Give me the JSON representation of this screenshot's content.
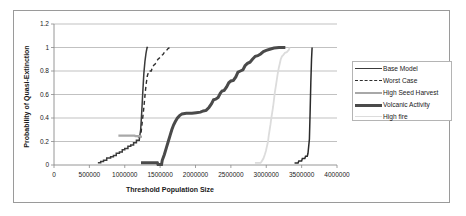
{
  "chart_data": {
    "type": "line",
    "title": "",
    "xlabel": "Threshold Population Size",
    "ylabel": "Probability of Quasi-Extinction",
    "xlim": [
      0,
      4000000
    ],
    "ylim": [
      0,
      1.2
    ],
    "xticks": [
      0,
      500000,
      1000000,
      1500000,
      2000000,
      2500000,
      3000000,
      3500000,
      4000000
    ],
    "xtick_labels": [
      "0",
      "500000",
      "1000000",
      "1500000",
      "2000000",
      "2500000",
      "3000000",
      "3500000",
      "4000000"
    ],
    "yticks": [
      0,
      0.2,
      0.4,
      0.6,
      0.8,
      1,
      1.2
    ],
    "ytick_labels": [
      "0",
      "0.2",
      "0.4",
      "0.6",
      "0.8",
      "1",
      "1.2"
    ],
    "grid": "horizontal",
    "legend_position": "right",
    "series": [
      {
        "name": "Base Model",
        "color": "#3b3b3b",
        "width": 1.5,
        "dash": "none",
        "points": [
          [
            620000,
            0.02
          ],
          [
            660000,
            0.02
          ],
          [
            660000,
            0.03
          ],
          [
            700000,
            0.03
          ],
          [
            700000,
            0.04
          ],
          [
            745000,
            0.04
          ],
          [
            745000,
            0.06
          ],
          [
            800000,
            0.06
          ],
          [
            800000,
            0.07
          ],
          [
            840000,
            0.07
          ],
          [
            840000,
            0.08
          ],
          [
            880000,
            0.08
          ],
          [
            880000,
            0.1
          ],
          [
            925000,
            0.1
          ],
          [
            925000,
            0.11
          ],
          [
            965000,
            0.11
          ],
          [
            965000,
            0.13
          ],
          [
            1000000,
            0.13
          ],
          [
            1000000,
            0.14
          ],
          [
            1045000,
            0.14
          ],
          [
            1045000,
            0.16
          ],
          [
            1085000,
            0.16
          ],
          [
            1085000,
            0.17
          ],
          [
            1125000,
            0.17
          ],
          [
            1125000,
            0.19
          ],
          [
            1165000,
            0.19
          ],
          [
            1165000,
            0.21
          ],
          [
            1205000,
            0.21
          ],
          [
            1210000,
            0.24
          ],
          [
            1225000,
            0.3
          ],
          [
            1240000,
            0.45
          ],
          [
            1255000,
            0.62
          ],
          [
            1270000,
            0.78
          ],
          [
            1285000,
            0.88
          ],
          [
            1300000,
            0.95
          ],
          [
            1315000,
            1.0
          ],
          [
            1330000,
            1.0
          ]
        ]
      },
      {
        "name": "Worst Case",
        "color": "#2e2e2e",
        "width": 1.4,
        "dash": "4,3",
        "points": [
          [
            1185000,
            0.24
          ],
          [
            1225000,
            0.24
          ],
          [
            1235000,
            0.3
          ],
          [
            1250000,
            0.38
          ],
          [
            1265000,
            0.46
          ],
          [
            1278000,
            0.54
          ],
          [
            1290000,
            0.62
          ],
          [
            1305000,
            0.7
          ],
          [
            1320000,
            0.76
          ],
          [
            1340000,
            0.8
          ],
          [
            1375000,
            0.8
          ],
          [
            1390000,
            0.83
          ],
          [
            1410000,
            0.85
          ],
          [
            1430000,
            0.86
          ],
          [
            1450000,
            0.88
          ],
          [
            1470000,
            0.9
          ],
          [
            1490000,
            0.91
          ],
          [
            1515000,
            0.93
          ],
          [
            1540000,
            0.94
          ],
          [
            1560000,
            0.96
          ],
          [
            1585000,
            0.97
          ],
          [
            1610000,
            0.99
          ],
          [
            1635000,
            1.0
          ]
        ]
      },
      {
        "name": "High Seed Harvest",
        "color": "#a8a8a8",
        "width": 2.2,
        "dash": "none",
        "points": [
          [
            910000,
            0.25
          ],
          [
            1140000,
            0.25
          ],
          [
            1150000,
            0.245
          ],
          [
            1215000,
            0.245
          ],
          [
            1222000,
            0.24
          ],
          [
            1240000,
            0.24
          ]
        ]
      },
      {
        "name": "Volcanic Activity",
        "color": "#4a4a4a",
        "width": 3.0,
        "dash": "none",
        "points": [
          [
            1230000,
            0.02
          ],
          [
            1400000,
            0.02
          ],
          [
            1460000,
            0.02
          ],
          [
            1470000,
            0.005
          ],
          [
            1520000,
            0.005
          ],
          [
            1530000,
            0.04
          ],
          [
            1560000,
            0.09
          ],
          [
            1590000,
            0.15
          ],
          [
            1615000,
            0.2
          ],
          [
            1640000,
            0.25
          ],
          [
            1665000,
            0.3
          ],
          [
            1690000,
            0.34
          ],
          [
            1715000,
            0.37
          ],
          [
            1745000,
            0.4
          ],
          [
            1775000,
            0.42
          ],
          [
            1810000,
            0.435
          ],
          [
            1870000,
            0.44
          ],
          [
            1950000,
            0.44
          ],
          [
            2010000,
            0.445
          ],
          [
            2070000,
            0.45
          ],
          [
            2110000,
            0.46
          ],
          [
            2150000,
            0.465
          ],
          [
            2190000,
            0.49
          ],
          [
            2225000,
            0.52
          ],
          [
            2255000,
            0.555
          ],
          [
            2285000,
            0.56
          ],
          [
            2320000,
            0.575
          ],
          [
            2350000,
            0.61
          ],
          [
            2375000,
            0.63
          ],
          [
            2405000,
            0.635
          ],
          [
            2440000,
            0.665
          ],
          [
            2470000,
            0.7
          ],
          [
            2500000,
            0.715
          ],
          [
            2535000,
            0.72
          ],
          [
            2570000,
            0.75
          ],
          [
            2600000,
            0.79
          ],
          [
            2635000,
            0.8
          ],
          [
            2670000,
            0.81
          ],
          [
            2700000,
            0.845
          ],
          [
            2735000,
            0.865
          ],
          [
            2770000,
            0.875
          ],
          [
            2805000,
            0.9
          ],
          [
            2845000,
            0.925
          ],
          [
            2880000,
            0.93
          ],
          [
            2920000,
            0.945
          ],
          [
            2960000,
            0.965
          ],
          [
            3000000,
            0.975
          ],
          [
            3050000,
            0.985
          ],
          [
            3110000,
            0.995
          ],
          [
            3180000,
            1.0
          ],
          [
            3270000,
            1.0
          ]
        ]
      },
      {
        "name": "High fire",
        "color": "#dcdcdc",
        "width": 1.8,
        "dash": "none",
        "points": [
          [
            2840000,
            0.018
          ],
          [
            2920000,
            0.018
          ],
          [
            2935000,
            0.03
          ],
          [
            2960000,
            0.055
          ],
          [
            2980000,
            0.09
          ],
          [
            2995000,
            0.12
          ],
          [
            3010000,
            0.16
          ],
          [
            3025000,
            0.2
          ],
          [
            3035000,
            0.25
          ],
          [
            3048000,
            0.3
          ],
          [
            3060000,
            0.345
          ],
          [
            3072000,
            0.4
          ],
          [
            3085000,
            0.45
          ],
          [
            3098000,
            0.5
          ],
          [
            3110000,
            0.56
          ],
          [
            3122000,
            0.62
          ],
          [
            3135000,
            0.67
          ],
          [
            3148000,
            0.72
          ],
          [
            3160000,
            0.77
          ],
          [
            3175000,
            0.82
          ],
          [
            3190000,
            0.86
          ],
          [
            3205000,
            0.9
          ],
          [
            3222000,
            0.925
          ],
          [
            3240000,
            0.935
          ],
          [
            3265000,
            0.955
          ],
          [
            3290000,
            0.96
          ],
          [
            3320000,
            0.98
          ],
          [
            3330000,
            1.0
          ]
        ]
      },
      {
        "name": "Volcanic Activity tail",
        "color": "#2b2b2b",
        "width": 1.5,
        "dash": "none",
        "points": [
          [
            3400000,
            0.018
          ],
          [
            3450000,
            0.018
          ],
          [
            3460000,
            0.035
          ],
          [
            3500000,
            0.035
          ],
          [
            3510000,
            0.055
          ],
          [
            3545000,
            0.055
          ],
          [
            3555000,
            0.075
          ],
          [
            3580000,
            0.075
          ],
          [
            3590000,
            0.1
          ],
          [
            3610000,
            0.22
          ],
          [
            3620000,
            0.45
          ],
          [
            3630000,
            0.7
          ],
          [
            3640000,
            0.9
          ],
          [
            3648000,
            1.0
          ]
        ]
      }
    ],
    "legend": [
      {
        "label": "Base Model",
        "style": "sw-base"
      },
      {
        "label": "Worst Case",
        "style": "sw-worst"
      },
      {
        "label": "High Seed Harvest",
        "style": "sw-seed"
      },
      {
        "label": "Volcanic Activity",
        "style": "sw-volcanic"
      },
      {
        "label": "High fire",
        "style": "sw-fire"
      }
    ]
  }
}
